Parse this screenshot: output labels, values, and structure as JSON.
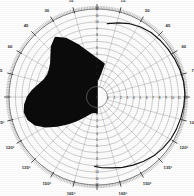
{
  "figure": {
    "kind": "polar-diagram",
    "background_color": "#fdfdfd",
    "grid_color": "#6e6e6e",
    "fill_color": "#0b0b0b",
    "trace_color": "#111111",
    "label_color": "#2b2b2b",
    "center": {
      "x": 97,
      "y": 97
    },
    "outer_radius": 88
  },
  "chart_data": {
    "type": "line",
    "subtype": "polar",
    "title": "",
    "subtitle": "",
    "xlabel": "",
    "ylabel": "",
    "grid": true,
    "legend": null,
    "angular_axis": {
      "unit": "degrees",
      "zero_position": "top",
      "mirrored": true,
      "major_step": 15,
      "minor_step": 1,
      "range": [
        0,
        180
      ],
      "tick_labels_right": [
        "0",
        "15",
        "30",
        "45",
        "60",
        "75",
        "90",
        "105",
        "120",
        "135",
        "150",
        "165",
        "180"
      ],
      "tick_labels_left": [
        "0",
        "15",
        "30",
        "45",
        "60",
        "75",
        "90",
        "105",
        "120",
        "135",
        "150",
        "165",
        "180"
      ],
      "degree_symbol_on_lower_labels": true
    },
    "radial_axis": {
      "rings": 12,
      "ring_labels": [
        "0",
        "1",
        "2",
        "3",
        "4",
        "5",
        "6",
        "7",
        "8",
        "9",
        "10",
        "11",
        "12"
      ],
      "label_axis_angle_deg": 0,
      "rlim": [
        0,
        12
      ],
      "inner_hub_radius_fraction": 0.12
    },
    "series": [
      {
        "name": "main-lobe",
        "style": "filled",
        "fill": true,
        "color": "#0b0b0b",
        "points_deg_r": [
          [
            0,
            0.08
          ],
          [
            4,
            0.1
          ],
          [
            8,
            0.16
          ],
          [
            12,
            0.3
          ],
          [
            340,
            0.58
          ],
          [
            332,
            0.72
          ],
          [
            325,
            0.8
          ],
          [
            318,
            0.74
          ],
          [
            312,
            0.66
          ],
          [
            306,
            0.6
          ],
          [
            300,
            0.57
          ],
          [
            294,
            0.56
          ],
          [
            288,
            0.58
          ],
          [
            282,
            0.63
          ],
          [
            276,
            0.7
          ],
          [
            270,
            0.76
          ],
          [
            264,
            0.8
          ],
          [
            258,
            0.82
          ],
          [
            252,
            0.8
          ],
          [
            246,
            0.74
          ],
          [
            240,
            0.63
          ],
          [
            234,
            0.5
          ],
          [
            228,
            0.38
          ],
          [
            222,
            0.28
          ],
          [
            216,
            0.2
          ],
          [
            210,
            0.14
          ],
          [
            204,
            0.1
          ],
          [
            198,
            0.07
          ],
          [
            192,
            0.06
          ],
          [
            186,
            0.06
          ],
          [
            180,
            0.07
          ]
        ]
      },
      {
        "name": "outer-trace",
        "style": "line",
        "fill": false,
        "color": "#111111",
        "points_deg_r": [
          [
            8,
            0.82
          ],
          [
            16,
            0.86
          ],
          [
            24,
            0.9
          ],
          [
            32,
            0.93
          ],
          [
            40,
            0.95
          ],
          [
            48,
            0.96
          ],
          [
            56,
            0.97
          ],
          [
            64,
            0.98
          ],
          [
            72,
            0.99
          ],
          [
            80,
            1.0
          ],
          [
            88,
            1.0
          ],
          [
            96,
            0.99
          ],
          [
            104,
            0.98
          ],
          [
            112,
            0.97
          ],
          [
            120,
            0.96
          ],
          [
            128,
            0.94
          ],
          [
            136,
            0.92
          ],
          [
            144,
            0.89
          ],
          [
            152,
            0.86
          ],
          [
            160,
            0.83
          ],
          [
            168,
            0.8
          ],
          [
            176,
            0.78
          ],
          [
            182,
            0.76
          ]
        ]
      }
    ],
    "annotations": []
  }
}
